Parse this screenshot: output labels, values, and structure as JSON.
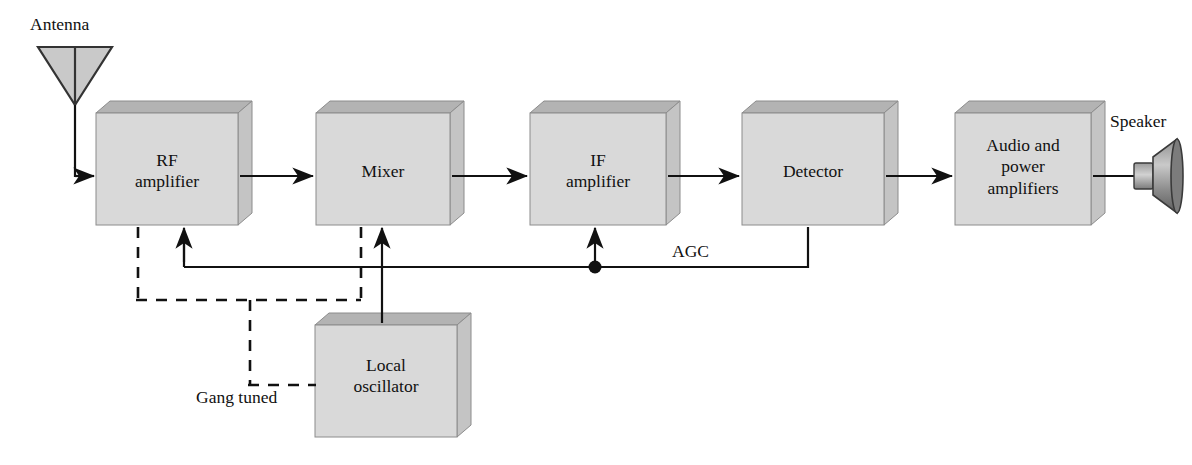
{
  "diagram": {
    "type": "block-diagram",
    "colors": {
      "box_front": "#d9d9d9",
      "box_top": "#b3b3b3",
      "box_side": "#c4c4c4",
      "box_stroke": "#8c8c8c",
      "line": "#111111",
      "text": "#111111",
      "background": "#ffffff"
    },
    "blocks": [
      {
        "id": "rf",
        "label": "RF\namplifier",
        "x": 96,
        "y": 113,
        "w": 142,
        "h": 112
      },
      {
        "id": "mixer",
        "label": "Mixer",
        "x": 316,
        "y": 113,
        "w": 134,
        "h": 112
      },
      {
        "id": "if",
        "label": "IF\namplifier",
        "x": 530,
        "y": 113,
        "w": 136,
        "h": 112
      },
      {
        "id": "detector",
        "label": "Detector",
        "x": 742,
        "y": 113,
        "w": 142,
        "h": 112
      },
      {
        "id": "audio",
        "label": "Audio and\npower\namplifiers",
        "x": 955,
        "y": 113,
        "w": 136,
        "h": 112
      },
      {
        "id": "lo",
        "label": "Local\noscillator",
        "x": 315,
        "y": 325,
        "w": 142,
        "h": 112
      }
    ],
    "free_labels": [
      {
        "id": "antenna",
        "text": "Antenna",
        "x": 30,
        "y": 14
      },
      {
        "id": "speaker",
        "text": "Speaker",
        "x": 1110,
        "y": 111
      },
      {
        "id": "agc",
        "text": "AGC",
        "x": 672,
        "y": 241
      },
      {
        "id": "gang-tuned",
        "text": "Gang tuned",
        "x": 196,
        "y": 387
      }
    ],
    "icons": [
      {
        "id": "antenna-icon",
        "name": "antenna-triangle-icon"
      },
      {
        "id": "speaker-icon",
        "name": "speaker-horn-icon"
      },
      {
        "id": "junction-dot",
        "name": "junction-dot-icon"
      }
    ],
    "signal_path": [
      {
        "from": "antenna",
        "to": "rf"
      },
      {
        "from": "rf",
        "to": "mixer"
      },
      {
        "from": "mixer",
        "to": "if"
      },
      {
        "from": "if",
        "to": "detector"
      },
      {
        "from": "detector",
        "to": "audio"
      },
      {
        "from": "audio",
        "to": "speaker"
      },
      {
        "from": "lo",
        "to": "mixer"
      },
      {
        "from": "detector",
        "to": "if",
        "via": "AGC"
      },
      {
        "from": "detector",
        "to": "rf",
        "via": "AGC"
      }
    ],
    "tuning_link": {
      "style": "dashed",
      "label": "Gang tuned",
      "connects": [
        "rf",
        "mixer",
        "lo"
      ]
    }
  }
}
